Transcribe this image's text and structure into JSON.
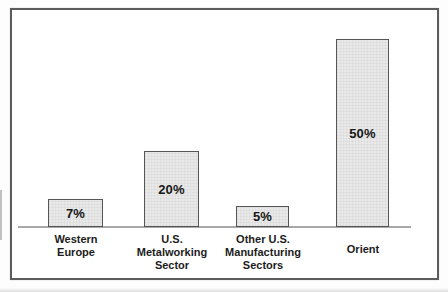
{
  "chart_data": {
    "type": "bar",
    "title": "",
    "xlabel": "",
    "ylabel": "",
    "ylim": [
      0,
      55
    ],
    "grid": false,
    "legend": false,
    "categories": [
      "Western Europe",
      "U.S. Metalworking Sector",
      "Other U.S. Manufacturing Sectors",
      "Orient"
    ],
    "values": [
      7,
      20,
      5,
      50
    ],
    "bars": [
      {
        "value": 7,
        "value_label": "7%",
        "category_lines": [
          "Western",
          "Europe"
        ]
      },
      {
        "value": 20,
        "value_label": "20%",
        "category_lines": [
          "U.S.",
          "Metalworking",
          "Sector"
        ]
      },
      {
        "value": 5,
        "value_label": "5%",
        "category_lines": [
          "Other U.S.",
          "Manufacturing",
          "Sectors"
        ]
      },
      {
        "value": 50,
        "value_label": "50%",
        "category_lines": [
          "Orient"
        ]
      }
    ],
    "colors": {
      "bar_fill": "#e9e9e9",
      "bar_border": "#565656",
      "frame_border": "#5c5c5c",
      "baseline": "#a8a8a8",
      "text": "#161616"
    }
  }
}
